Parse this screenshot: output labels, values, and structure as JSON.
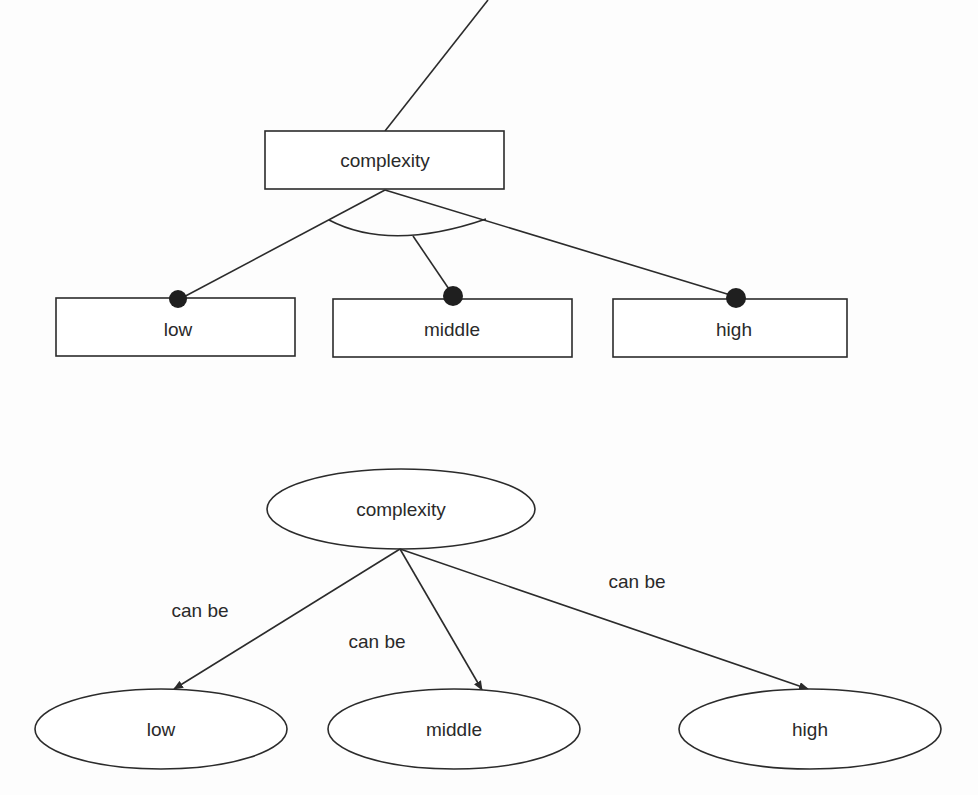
{
  "figure_top": {
    "style": "generalization-with-constraint-arc",
    "parent": {
      "label": "complexity",
      "shape": "rectangle"
    },
    "children": [
      {
        "label": "low",
        "shape": "rectangle"
      },
      {
        "label": "middle",
        "shape": "rectangle"
      },
      {
        "label": "high",
        "shape": "rectangle"
      }
    ]
  },
  "figure_bottom": {
    "style": "semantic-network",
    "parent": {
      "label": "complexity",
      "shape": "ellipse"
    },
    "children": [
      {
        "label": "low",
        "shape": "ellipse",
        "edge_label": "can be"
      },
      {
        "label": "middle",
        "shape": "ellipse",
        "edge_label": "can be"
      },
      {
        "label": "high",
        "shape": "ellipse",
        "edge_label": "can be"
      }
    ]
  },
  "colors": {
    "line": "#2b2b2b",
    "text": "#2a2a2a",
    "background": "#fdfdfd"
  }
}
